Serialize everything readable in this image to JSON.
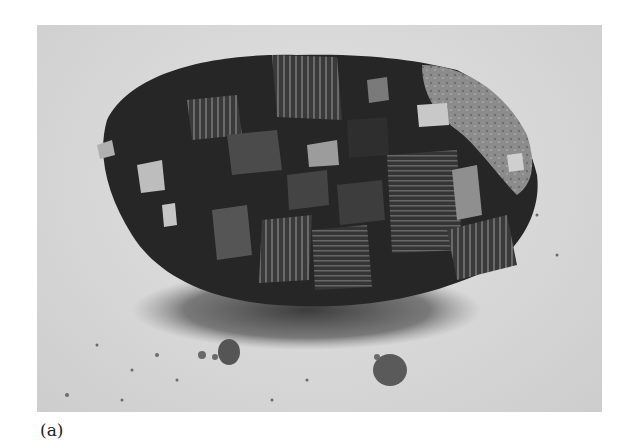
{
  "figure": {
    "label": "(a)",
    "photo": {
      "subject": "mineral specimen with cubic metallic crystals on matrix",
      "style": "grayscale photograph",
      "background_color": "#d8d8d8",
      "crystal_dark": "#1e1e1e",
      "crystal_mid": "#4a4a4a",
      "crystal_light": "#9a9a9a",
      "matrix_color": "#8a8a8a"
    }
  }
}
